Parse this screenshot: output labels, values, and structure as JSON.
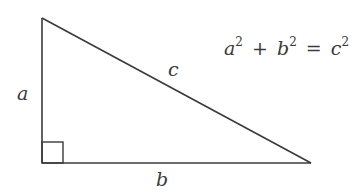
{
  "diagram": {
    "stroke_color": "#3a3a3a",
    "vertices": {
      "top": [
        42,
        18
      ],
      "right_angle": [
        42,
        163
      ],
      "bottom_right": [
        311,
        163
      ]
    },
    "right_angle_marker_size": 21,
    "labels": {
      "a": "a",
      "b": "b",
      "c": "c"
    },
    "equation": {
      "term1_var": "a",
      "term1_exp": "2",
      "plus": "+",
      "term2_var": "b",
      "term2_exp": "2",
      "equals": "=",
      "term3_var": "c",
      "term3_exp": "2"
    }
  }
}
